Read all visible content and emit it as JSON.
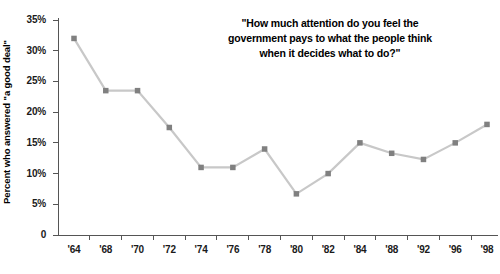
{
  "chart_data": {
    "type": "line",
    "title_lines": [
      "\"How much attention do you feel the",
      "government pays to what the people think",
      "when it decides what to do?\""
    ],
    "xlabel": "",
    "ylabel": "Percent who answered \"a good deal\"",
    "categories": [
      "'64",
      "'68",
      "'70",
      "'72",
      "'74",
      "'76",
      "'78",
      "'80",
      "'82",
      "'84",
      "'88",
      "'92",
      "'96",
      "'98"
    ],
    "values": [
      32,
      23.5,
      23.5,
      17.5,
      11,
      11,
      14,
      6.7,
      10,
      15,
      13.3,
      12.3,
      15,
      18
    ],
    "ylim": [
      0,
      35
    ],
    "ytick_values": [
      0,
      5,
      10,
      15,
      20,
      25,
      30,
      35
    ],
    "ytick_labels": [
      "0",
      "5%",
      "10%",
      "15%",
      "20%",
      "25%",
      "30%",
      "35%"
    ],
    "grid": false,
    "legend": "none",
    "marker": "square",
    "colors": {
      "line": "#c8c8c8",
      "marker": "#808080",
      "axis": "#555555",
      "text": "#1a1a1a"
    }
  }
}
